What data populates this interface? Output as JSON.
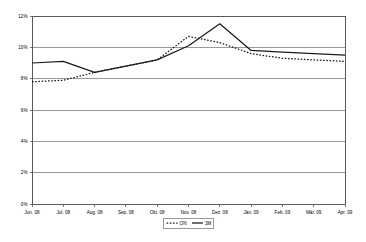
{
  "chart_data": {
    "type": "line",
    "title": "",
    "subtitle": "",
    "xlabel": "",
    "ylabel": "",
    "categories": [
      "Jun. 08",
      "Jul. 08",
      "Aug. 08",
      "Sep. 08",
      "Okt. 08",
      "Nov. 08",
      "Dez. 08",
      "Jän. 09",
      "Feb. 09",
      "Mär. 09",
      "Apr. 09"
    ],
    "series": [
      {
        "name": "ON",
        "style": "dotted",
        "color": "#1a1a1a",
        "values": [
          7.8,
          7.9,
          8.4,
          8.8,
          9.2,
          10.7,
          10.3,
          9.6,
          9.3,
          9.2,
          9.1
        ]
      },
      {
        "name": "3M",
        "style": "solid",
        "color": "#1a1a1a",
        "values": [
          9.0,
          9.1,
          8.4,
          8.8,
          9.2,
          10.1,
          11.5,
          9.8,
          9.7,
          9.6,
          9.5
        ]
      }
    ],
    "ylim": [
      0,
      12
    ],
    "ytick_values": [
      0,
      2,
      4,
      6,
      8,
      10,
      12
    ],
    "ytick_labels": [
      "0%",
      "2%",
      "4%",
      "6%",
      "8%",
      "10%",
      "12%"
    ],
    "grid": true,
    "grid_axis": "y",
    "legend_position": "bottom",
    "legend_entries": [
      "ON",
      "3M"
    ]
  },
  "colors": {
    "background": "#ffffff",
    "grid": "#808080",
    "axis": "#595959",
    "line": "#1a1a1a",
    "legend_border": "#6e6e6e"
  }
}
